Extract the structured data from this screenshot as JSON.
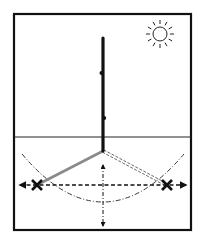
{
  "diagram": {
    "colors": {
      "background": "#ffffff",
      "ink": "#111111",
      "shadow_first": "#8a8a8a",
      "shadow_second": "#444444"
    },
    "frame": {
      "x": 14,
      "y": 14,
      "width": 177,
      "height": 216
    },
    "sun": {
      "icon": "sun-icon",
      "cx": 160,
      "cy": 34,
      "r": 7,
      "rays": 12
    },
    "stick": {
      "x": 103,
      "top": 38,
      "base": 151
    },
    "ground_line": {
      "y": 137
    },
    "shadows": [
      {
        "label": "first-shadow",
        "from": [
          103,
          151
        ],
        "to": [
          37,
          185
        ],
        "style": "solid-grey"
      },
      {
        "label": "second-shadow",
        "from": [
          103,
          151
        ],
        "to": [
          167,
          185
        ],
        "style": "double-dashed"
      }
    ],
    "marks": [
      {
        "label": "first-shadow-tip-mark",
        "x": 37,
        "y": 185,
        "symbol": "x-mark"
      },
      {
        "label": "second-shadow-tip-mark",
        "x": 167,
        "y": 185,
        "symbol": "x-mark"
      }
    ],
    "east_west_line": {
      "y": 185,
      "x1": 20,
      "x2": 186,
      "arrows": "both"
    },
    "north_south_line": {
      "x": 103,
      "y1": 165,
      "y2": 226,
      "arrows": "both"
    },
    "arc": {
      "start": [
        22,
        154
      ],
      "control": [
        103,
        250
      ],
      "end": [
        184,
        154
      ],
      "style": "dash-dot"
    }
  }
}
